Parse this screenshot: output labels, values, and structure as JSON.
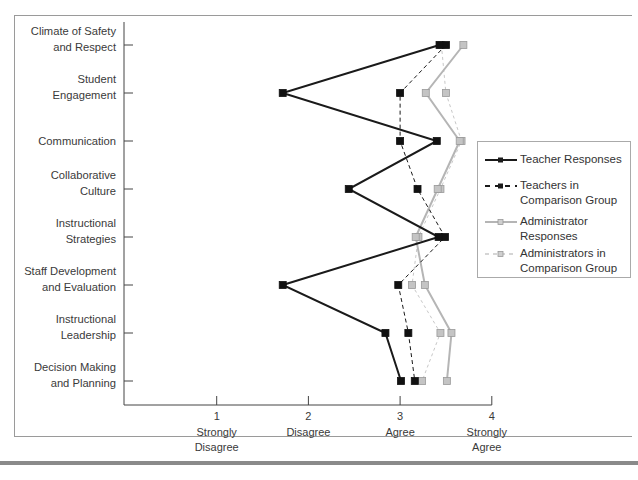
{
  "chart_data": {
    "type": "line",
    "orientation": "horizontal-profile",
    "title": "",
    "xlabel": "",
    "ylabel": "",
    "xlim": [
      0,
      4
    ],
    "x_ticks": [
      {
        "value": 1,
        "label": "1",
        "sublabel": [
          "Strongly",
          "Disagree"
        ]
      },
      {
        "value": 2,
        "label": "2",
        "sublabel": [
          "Disagree"
        ]
      },
      {
        "value": 3,
        "label": "3",
        "sublabel": [
          "Agree"
        ]
      },
      {
        "value": 4,
        "label": "4",
        "sublabel": [
          "Strongly",
          "Agree"
        ]
      }
    ],
    "categories": [
      [
        "Climate of Safety",
        "and Respect"
      ],
      [
        "Student",
        "Engagement"
      ],
      [
        "Communication"
      ],
      [
        "Collaborative",
        "Culture"
      ],
      [
        "Instructional",
        "Strategies"
      ],
      [
        "Staff Development",
        "and Evaluation"
      ],
      [
        "Instructional",
        "Leadership"
      ],
      [
        "Decision Making",
        "and Planning"
      ]
    ],
    "series": [
      {
        "name": "Teacher Responses",
        "color": "#1a1a1a",
        "style": "solid",
        "width": 2,
        "marker": "filled-square",
        "values": [
          3.43,
          1.72,
          3.4,
          2.44,
          3.42,
          1.72,
          2.84,
          3.01
        ]
      },
      {
        "name": "Teachers in Comparison Group",
        "color": "#1a1a1a",
        "style": "dashed",
        "width": 1,
        "marker": "filled-square",
        "values": [
          3.5,
          3.0,
          3.0,
          3.19,
          3.49,
          2.98,
          3.09,
          3.16
        ]
      },
      {
        "name": "Administrator Responses",
        "color": "#b5b5b5",
        "style": "solid",
        "width": 2,
        "marker": "gray-square",
        "values": [
          3.69,
          3.28,
          3.65,
          3.41,
          3.17,
          3.27,
          3.56,
          3.51
        ]
      },
      {
        "name": "Administrators in Comparison Group",
        "color": "#c8c8c8",
        "style": "dashed",
        "width": 1,
        "marker": "gray-square",
        "values": [
          3.45,
          3.5,
          3.67,
          3.44,
          3.2,
          3.13,
          3.44,
          3.24
        ]
      }
    ],
    "legend_position": "right",
    "grid": false
  },
  "legend": {
    "items": [
      {
        "label": "Teacher Responses"
      },
      {
        "label": "Teachers in Comparison Group"
      },
      {
        "label": "Administrator Responses"
      },
      {
        "label": "Administrators in Comparison Group"
      }
    ]
  }
}
